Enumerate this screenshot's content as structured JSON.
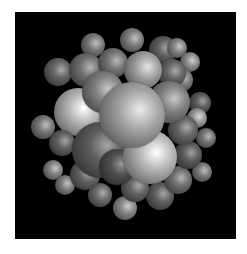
{
  "image": {
    "description": "Rendered 3D cluster of gray shaded spheres on black background",
    "background": "#000000",
    "border": "#ffffff",
    "frame": {
      "x": 15,
      "y": 12,
      "w": 221,
      "h": 227
    }
  },
  "spheres": [
    {
      "x": 93,
      "y": 45,
      "r": 12,
      "shade": 120
    },
    {
      "x": 132,
      "y": 40,
      "r": 12,
      "shade": 125
    },
    {
      "x": 163,
      "y": 50,
      "r": 14,
      "shade": 95
    },
    {
      "x": 177,
      "y": 48,
      "r": 10,
      "shade": 130
    },
    {
      "x": 190,
      "y": 62,
      "r": 10,
      "shade": 140
    },
    {
      "x": 58,
      "y": 72,
      "r": 14,
      "shade": 100
    },
    {
      "x": 86,
      "y": 70,
      "r": 17,
      "shade": 110
    },
    {
      "x": 113,
      "y": 63,
      "r": 15,
      "shade": 115
    },
    {
      "x": 181,
      "y": 80,
      "r": 12,
      "shade": 120
    },
    {
      "x": 172,
      "y": 73,
      "r": 14,
      "shade": 100
    },
    {
      "x": 143,
      "y": 70,
      "r": 19,
      "shade": 160
    },
    {
      "x": 200,
      "y": 103,
      "r": 11,
      "shade": 90
    },
    {
      "x": 197,
      "y": 118,
      "r": 10,
      "shade": 150
    },
    {
      "x": 43,
      "y": 127,
      "r": 12,
      "shade": 120
    },
    {
      "x": 206,
      "y": 138,
      "r": 10,
      "shade": 115
    },
    {
      "x": 53,
      "y": 170,
      "r": 10,
      "shade": 130
    },
    {
      "x": 65,
      "y": 185,
      "r": 10,
      "shade": 125
    },
    {
      "x": 202,
      "y": 172,
      "r": 10,
      "shade": 120
    },
    {
      "x": 125,
      "y": 208,
      "r": 12,
      "shade": 135
    },
    {
      "x": 160,
      "y": 196,
      "r": 14,
      "shade": 95
    },
    {
      "x": 100,
      "y": 195,
      "r": 12,
      "shade": 105
    },
    {
      "x": 78,
      "y": 112,
      "r": 24,
      "shade": 185
    },
    {
      "x": 62,
      "y": 143,
      "r": 13,
      "shade": 95
    },
    {
      "x": 85,
      "y": 175,
      "r": 15,
      "shade": 100
    },
    {
      "x": 135,
      "y": 188,
      "r": 14,
      "shade": 100
    },
    {
      "x": 178,
      "y": 180,
      "r": 14,
      "shade": 110
    },
    {
      "x": 188,
      "y": 155,
      "r": 14,
      "shade": 90
    },
    {
      "x": 183,
      "y": 130,
      "r": 15,
      "shade": 100
    },
    {
      "x": 103,
      "y": 92,
      "r": 21,
      "shade": 130
    },
    {
      "x": 169,
      "y": 102,
      "r": 21,
      "shade": 130
    },
    {
      "x": 100,
      "y": 150,
      "r": 28,
      "shade": 95
    },
    {
      "x": 117,
      "y": 167,
      "r": 18,
      "shade": 80
    },
    {
      "x": 150,
      "y": 157,
      "r": 27,
      "shade": 185
    },
    {
      "x": 132,
      "y": 115,
      "r": 33,
      "shade": 165
    }
  ]
}
